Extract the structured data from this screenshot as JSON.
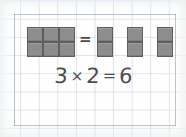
{
  "worksheet": {
    "title": "multiplication array worksheet",
    "background": "grid-paper",
    "grid_color": "#96a5b4",
    "paper_color": "#fefefe"
  },
  "equation": {
    "left_factor": "3",
    "times_symbol": "×",
    "right_factor": "2",
    "equals_symbol": "=",
    "product": "6",
    "full_text": "3 × 2 = 6",
    "ink_color": "#4d4d4d"
  },
  "symbols": {
    "between_models": "="
  },
  "models": {
    "block_color": "#8d8d8d",
    "block_border_color": "#5e5e5e",
    "array": {
      "label": "3 by 2 array of unit squares",
      "columns": 3,
      "rows": 2,
      "total": 6,
      "cells": [
        {
          "name": "array-cell-r1c1",
          "x": 27,
          "y": 27,
          "w": 16,
          "h": 15
        },
        {
          "name": "array-cell-r1c2",
          "x": 43,
          "y": 27,
          "w": 16,
          "h": 15
        },
        {
          "name": "array-cell-r1c3",
          "x": 59,
          "y": 27,
          "w": 16,
          "h": 15
        },
        {
          "name": "array-cell-r2c1",
          "x": 27,
          "y": 42,
          "w": 16,
          "h": 15
        },
        {
          "name": "array-cell-r2c2",
          "x": 43,
          "y": 42,
          "w": 16,
          "h": 15
        },
        {
          "name": "array-cell-r2c3",
          "x": 59,
          "y": 42,
          "w": 16,
          "h": 15
        }
      ]
    },
    "groups": {
      "label": "three groups of two unit squares",
      "group_count": 3,
      "per_group": 2,
      "total": 6,
      "cells": [
        {
          "name": "group-1-cell-top",
          "x": 97,
          "y": 27,
          "w": 16,
          "h": 15
        },
        {
          "name": "group-1-cell-bottom",
          "x": 97,
          "y": 42,
          "w": 16,
          "h": 15
        },
        {
          "name": "group-2-cell-top",
          "x": 127,
          "y": 27,
          "w": 16,
          "h": 15
        },
        {
          "name": "group-2-cell-bottom",
          "x": 127,
          "y": 42,
          "w": 16,
          "h": 15
        },
        {
          "name": "group-3-cell-top",
          "x": 157,
          "y": 27,
          "w": 16,
          "h": 15
        },
        {
          "name": "group-3-cell-bottom",
          "x": 157,
          "y": 42,
          "w": 16,
          "h": 15
        }
      ]
    }
  }
}
